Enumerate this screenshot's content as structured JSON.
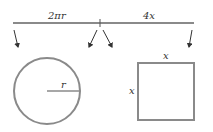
{
  "diagram": {
    "segment_labels": {
      "left": "2πr",
      "right": "4x"
    },
    "circle": {
      "radius_label": "r"
    },
    "square": {
      "top_label": "x",
      "left_label": "x"
    },
    "colors": {
      "stroke": "#8a8a8a",
      "text": "#333333",
      "background": "#ffffff"
    }
  }
}
